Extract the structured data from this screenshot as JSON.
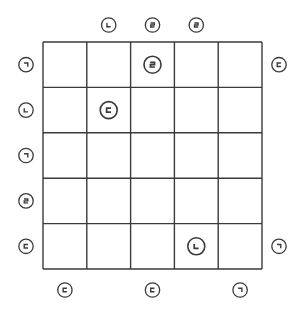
{
  "puzzle": {
    "rows": 5,
    "cols": 5,
    "colors": {
      "line": "#3a3a3a",
      "background": "#ffffff"
    },
    "grid_cells": [
      {
        "row": 1,
        "col": 3,
        "char": "ㄹ"
      },
      {
        "row": 2,
        "col": 2,
        "char": "ㄷ"
      },
      {
        "row": 5,
        "col": 4,
        "char": "ㄴ"
      }
    ],
    "top_clues": [
      {
        "col": 2,
        "char": "ㄴ"
      },
      {
        "col": 3,
        "char": "ㄹ"
      },
      {
        "col": 4,
        "char": "ㄹ"
      }
    ],
    "left_clues": [
      {
        "row": 1,
        "char": "ㄱ"
      },
      {
        "row": 2,
        "char": "ㄴ"
      },
      {
        "row": 3,
        "char": "ㄱ"
      },
      {
        "row": 4,
        "char": "ㄹ"
      },
      {
        "row": 5,
        "char": "ㄷ"
      }
    ],
    "right_clues": [
      {
        "row": 1,
        "char": "ㄷ"
      },
      {
        "row": 5,
        "char": "ㄱ"
      }
    ],
    "bottom_clues": [
      {
        "col": 1,
        "char": "ㄷ"
      },
      {
        "col": 3,
        "char": "ㄷ"
      },
      {
        "col": 5,
        "char": "ㄱ"
      }
    ]
  }
}
